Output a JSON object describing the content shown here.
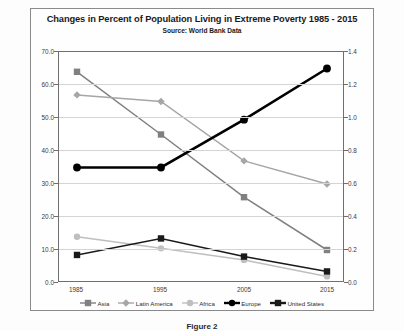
{
  "chart": {
    "title": "Changes in Percent of Population Living in Extreme Poverty 1985 - 2015",
    "subtitle": "Source: World Bank Data"
  },
  "caption": "Figure 2",
  "axes": {
    "left_ticks": [
      "70.0",
      "60.0",
      "50.0",
      "40.0",
      "30.0",
      "20.0",
      "10.0",
      "0.0"
    ],
    "right_ticks": [
      "1.4",
      "1.2",
      "1.0",
      "0.8",
      "0.6",
      "0.4",
      "0.2",
      "0.0"
    ],
    "x_ticks": [
      "1985",
      "1995",
      "2005",
      "2015"
    ]
  },
  "legend": [
    {
      "label": "Asia",
      "color": "#808080",
      "marker": "square"
    },
    {
      "label": "Latin America",
      "color": "#a6a6a6",
      "marker": "diamond"
    },
    {
      "label": "Africa",
      "color": "#bfbfbf",
      "marker": "circle"
    },
    {
      "label": "Europe",
      "color": "#000000",
      "marker": "circle"
    },
    {
      "label": "United States",
      "color": "#1a1a1a",
      "marker": "square"
    }
  ],
  "chart_data": {
    "type": "line",
    "title": "Changes in Percent of Population Living in Extreme Poverty 1985 - 2015",
    "subtitle": "Source: World Bank Data",
    "xlabel": "",
    "ylabel": "",
    "categories": [
      "1985",
      "1995",
      "2005",
      "2015"
    ],
    "ylim": [
      0,
      70
    ],
    "y2lim": [
      0,
      1.4
    ],
    "grid": true,
    "legend_position": "bottom",
    "series": [
      {
        "name": "Asia",
        "axis": "left",
        "color": "#808080",
        "marker": "square",
        "values": [
          64.0,
          45.0,
          26.0,
          10.0
        ]
      },
      {
        "name": "Latin America",
        "axis": "left",
        "color": "#a6a6a6",
        "marker": "diamond",
        "values": [
          57.0,
          55.0,
          37.0,
          30.0
        ]
      },
      {
        "name": "Africa",
        "axis": "left",
        "color": "#bfbfbf",
        "marker": "circle",
        "values": [
          14.0,
          10.5,
          7.0,
          2.0
        ]
      },
      {
        "name": "Europe",
        "axis": "right",
        "color": "#000000",
        "marker": "circle",
        "values": [
          0.7,
          0.7,
          0.99,
          1.3
        ]
      },
      {
        "name": "United States",
        "axis": "left",
        "color": "#1a1a1a",
        "marker": "square",
        "values": [
          8.5,
          13.5,
          8.0,
          3.5
        ]
      }
    ]
  }
}
